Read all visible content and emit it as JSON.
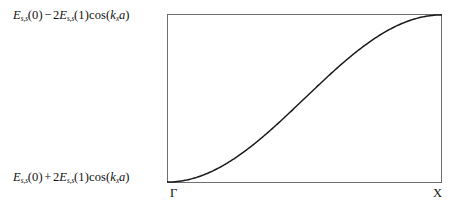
{
  "figure": {
    "type": "band-structure-dispersion",
    "background_color": "#ffffff",
    "line_color": "#1a1a1a",
    "frame_color": "#6e6e6e"
  },
  "labels": {
    "top": {
      "full_text": "E_{s,s}(0) - 2E_{s,s}(1)cos(k_x a)",
      "base1": "E",
      "sub1": "s,s",
      "arg1": "(0)",
      "operator": "−",
      "coefficient": "2",
      "base2": "E",
      "sub2": "s,s",
      "arg2": "(1)",
      "fn": "cos(",
      "k": "k",
      "ksub": "x",
      "a": "a",
      "close": ")"
    },
    "bottom": {
      "full_text": "E_{s,s}(0) + 2E_{s,s}(1)cos(k_x a)",
      "base1": "E",
      "sub1": "s,s",
      "arg1": "(0)",
      "operator": "+",
      "coefficient": "2",
      "base2": "E",
      "sub2": "s,s",
      "arg2": "(1)",
      "fn": "cos(",
      "k": "k",
      "ksub": "x",
      "a": "a",
      "close": ")"
    }
  },
  "kpoints": {
    "left": "Γ",
    "right": "X"
  },
  "chart_data": {
    "type": "line",
    "title": "",
    "xlabel": "",
    "ylabel": "",
    "grid": false,
    "legend": null,
    "xlim": [
      0,
      1
    ],
    "ylim": [
      0,
      1
    ],
    "xtick_positions": [
      0,
      1
    ],
    "xtick_labels": [
      "Γ",
      "X"
    ],
    "ytick_positions": [
      0,
      1
    ],
    "ytick_labels": [
      "E_{s,s}(0) + 2E_{s,s}(1)cos(k_x a)",
      "E_{s,s}(0) - 2E_{s,s}(1)cos(k_x a)"
    ],
    "equation": "y = (1 - cos(pi*x))/2",
    "series": [
      {
        "name": "s-band",
        "x": [
          0.0,
          0.05,
          0.1,
          0.15,
          0.2,
          0.25,
          0.3,
          0.35,
          0.4,
          0.45,
          0.5,
          0.55,
          0.6,
          0.65,
          0.7,
          0.75,
          0.8,
          0.85,
          0.9,
          0.95,
          1.0
        ],
        "y": [
          0.0,
          0.006,
          0.024,
          0.054,
          0.095,
          0.146,
          0.206,
          0.273,
          0.345,
          0.422,
          0.5,
          0.578,
          0.655,
          0.727,
          0.794,
          0.854,
          0.905,
          0.946,
          0.976,
          0.994,
          1.0
        ]
      }
    ]
  }
}
